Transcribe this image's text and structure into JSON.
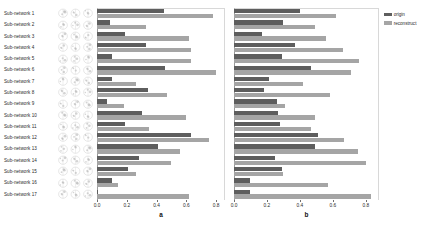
{
  "figure": {
    "row_labels": [
      "Sub-network 1",
      "Sub-network 2",
      "Sub-network 3",
      "Sub-network 4",
      "Sub-network 5",
      "Sub-network 6",
      "Sub-network 7",
      "Sub-network 8",
      "Sub-network 9",
      "Sub-network 10",
      "Sub-network 11",
      "Sub-network 12",
      "Sub-network 13",
      "Sub-network 14",
      "Sub-network 15",
      "Sub-network 16",
      "Sub-network 17"
    ],
    "thumbnail_name": "brain-slice-thumbnail",
    "legend": {
      "position": "top-right",
      "entries": [
        {
          "label": "origin",
          "color": "#5e5e5e"
        },
        {
          "label": "reconstruct",
          "color": "#a5a5a5"
        }
      ]
    },
    "colors": {
      "origin": "#5e5e5e",
      "reconstruct": "#a5a5a5",
      "axis": "#6e6e6e",
      "text": "#2b2b2b",
      "background": "#ffffff"
    }
  },
  "chart_data": [
    {
      "type": "bar",
      "orientation": "horizontal",
      "panel": "a",
      "title": "a",
      "xlabel": "",
      "ylabel": "",
      "xlim": [
        0.0,
        0.86
      ],
      "xticks": [
        0.0,
        0.2,
        0.4,
        0.6,
        0.8
      ],
      "xtick_labels": [
        "0.0",
        "0.2",
        "0.4",
        "0.6",
        "0.8"
      ],
      "grid": false,
      "legend": [
        "origin",
        "reconstruct"
      ],
      "categories": [
        "Sub-network 1",
        "Sub-network 2",
        "Sub-network 3",
        "Sub-network 4",
        "Sub-network 5",
        "Sub-network 6",
        "Sub-network 7",
        "Sub-network 8",
        "Sub-network 9",
        "Sub-network 10",
        "Sub-network 11",
        "Sub-network 12",
        "Sub-network 13",
        "Sub-network 14",
        "Sub-network 15",
        "Sub-network 16",
        "Sub-network 17"
      ],
      "series": [
        {
          "name": "origin",
          "color": "#5e5e5e",
          "values": [
            0.45,
            0.09,
            0.19,
            0.33,
            0.1,
            0.46,
            0.1,
            0.34,
            0.07,
            0.3,
            0.19,
            0.63,
            0.41,
            0.28,
            0.21,
            0.1,
            0.01
          ]
        },
        {
          "name": "reconstruct",
          "color": "#a5a5a5",
          "values": [
            0.78,
            0.33,
            0.62,
            0.63,
            0.63,
            0.8,
            0.26,
            0.47,
            0.18,
            0.6,
            0.35,
            0.75,
            0.56,
            0.5,
            0.26,
            0.14,
            0.62
          ]
        }
      ]
    },
    {
      "type": "bar",
      "orientation": "horizontal",
      "panel": "b",
      "title": "b",
      "xlabel": "",
      "ylabel": "",
      "xlim": [
        0.0,
        0.88
      ],
      "xticks": [
        0.0,
        0.2,
        0.4,
        0.6,
        0.8
      ],
      "xtick_labels": [
        "0.0",
        "0.2",
        "0.4",
        "0.6",
        "0.8"
      ],
      "grid": false,
      "legend": [
        "origin",
        "reconstruct"
      ],
      "categories": [
        "Sub-network 1",
        "Sub-network 2",
        "Sub-network 3",
        "Sub-network 4",
        "Sub-network 5",
        "Sub-network 6",
        "Sub-network 7",
        "Sub-network 8",
        "Sub-network 9",
        "Sub-network 10",
        "Sub-network 11",
        "Sub-network 12",
        "Sub-network 13",
        "Sub-network 14",
        "Sub-network 15",
        "Sub-network 16",
        "Sub-network 17"
      ],
      "series": [
        {
          "name": "origin",
          "color": "#5e5e5e",
          "values": [
            0.4,
            0.3,
            0.17,
            0.37,
            0.29,
            0.47,
            0.21,
            0.18,
            0.26,
            0.27,
            0.28,
            0.51,
            0.49,
            0.25,
            0.29,
            0.1,
            0.1
          ]
        },
        {
          "name": "reconstruct",
          "color": "#a5a5a5",
          "values": [
            0.62,
            0.49,
            0.56,
            0.66,
            0.76,
            0.71,
            0.42,
            0.58,
            0.31,
            0.49,
            0.47,
            0.67,
            0.75,
            0.8,
            0.3,
            0.57,
            0.83
          ]
        }
      ]
    }
  ]
}
